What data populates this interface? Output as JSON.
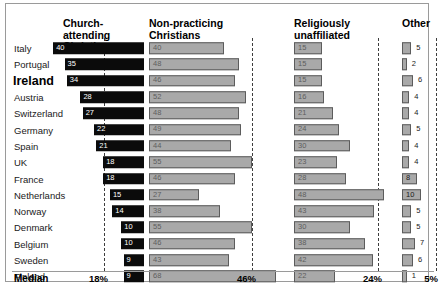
{
  "chart_data": {
    "type": "bar",
    "title": "",
    "orientation": "horizontal",
    "layout": "grouped-panels",
    "grid": false,
    "legend_position": "top-column-headers",
    "xlabel": "",
    "ylabel": "",
    "xlim": [
      0,
      70
    ],
    "categories": [
      "Italy",
      "Portugal",
      "Ireland",
      "Austria",
      "Switzerland",
      "Germany",
      "Spain",
      "UK",
      "France",
      "Netherlands",
      "Norway",
      "Denmark",
      "Belgium",
      "Sweden",
      "Finland"
    ],
    "highlight_category": "Ireland",
    "series": [
      {
        "name": "Church-attending Christians",
        "values": [
          40,
          35,
          34,
          28,
          27,
          22,
          21,
          18,
          18,
          15,
          14,
          10,
          10,
          9,
          9
        ],
        "median": 18,
        "color": "#0b0b0b"
      },
      {
        "name": "Non-practicing Christians",
        "values": [
          40,
          48,
          46,
          52,
          48,
          49,
          44,
          55,
          46,
          27,
          38,
          55,
          46,
          43,
          68
        ],
        "median": 46,
        "color": "#a9a9a9"
      },
      {
        "name": "Religiously unaffiliated",
        "values": [
          15,
          15,
          15,
          16,
          21,
          24,
          30,
          23,
          28,
          48,
          43,
          30,
          38,
          42,
          22
        ],
        "median": 24,
        "color": "#a9a9a9"
      },
      {
        "name": "Other",
        "values": [
          5,
          2,
          6,
          4,
          4,
          5,
          4,
          4,
          8,
          10,
          5,
          5,
          7,
          6,
          1
        ],
        "median": 5,
        "color": "#a9a9a9"
      }
    ]
  },
  "headers": {
    "col1": "Church-attending\nChristians",
    "col2": "Non-practicing\nChristians",
    "col3": "Religiously\nunaffiliated",
    "col4": "Other"
  },
  "median_row": {
    "label": "Median",
    "values": [
      "18%",
      "46%",
      "24%",
      "5%"
    ]
  }
}
